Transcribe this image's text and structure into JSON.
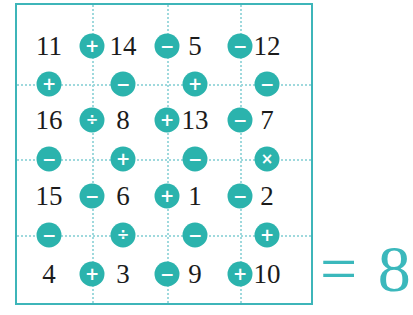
{
  "puzzle": {
    "title": "Math Operator Grid Puzzle",
    "result_text": "= 8",
    "result_equals": "=",
    "result_value": "8",
    "colors": {
      "accent_teal": "#2bb3ad",
      "border_teal": "#3db5b9",
      "guide_dotted": "#9fd9dd",
      "number_black": "#1b1b1b",
      "result_teal": "#3bb8bc",
      "background": "#ffffff"
    },
    "rows": [
      {
        "type": "numbers",
        "cells": [
          {
            "kind": "number",
            "text": "11"
          },
          {
            "kind": "operator",
            "text": "+",
            "name": "plus"
          },
          {
            "kind": "number",
            "text": "14"
          },
          {
            "kind": "operator",
            "text": "−",
            "name": "minus"
          },
          {
            "kind": "number",
            "text": "5"
          },
          {
            "kind": "operator",
            "text": "−",
            "name": "minus"
          },
          {
            "kind": "number",
            "text": "12"
          }
        ]
      },
      {
        "type": "operators",
        "cells": [
          {
            "kind": "operator",
            "text": "+",
            "name": "plus"
          },
          {
            "kind": "operator",
            "text": "−",
            "name": "minus"
          },
          {
            "kind": "operator",
            "text": "+",
            "name": "plus"
          },
          {
            "kind": "operator",
            "text": "−",
            "name": "minus"
          }
        ]
      },
      {
        "type": "numbers",
        "cells": [
          {
            "kind": "number",
            "text": "16"
          },
          {
            "kind": "operator",
            "text": "÷",
            "name": "divide"
          },
          {
            "kind": "number",
            "text": "8"
          },
          {
            "kind": "operator",
            "text": "+",
            "name": "plus"
          },
          {
            "kind": "number",
            "text": "13"
          },
          {
            "kind": "operator",
            "text": "−",
            "name": "minus"
          },
          {
            "kind": "number",
            "text": "7"
          }
        ]
      },
      {
        "type": "operators",
        "cells": [
          {
            "kind": "operator",
            "text": "−",
            "name": "minus"
          },
          {
            "kind": "operator",
            "text": "+",
            "name": "plus"
          },
          {
            "kind": "operator",
            "text": "−",
            "name": "minus"
          },
          {
            "kind": "operator",
            "text": "×",
            "name": "multiply"
          }
        ]
      },
      {
        "type": "numbers",
        "cells": [
          {
            "kind": "number",
            "text": "15"
          },
          {
            "kind": "operator",
            "text": "−",
            "name": "minus"
          },
          {
            "kind": "number",
            "text": "6"
          },
          {
            "kind": "operator",
            "text": "+",
            "name": "plus"
          },
          {
            "kind": "number",
            "text": "1"
          },
          {
            "kind": "operator",
            "text": "−",
            "name": "minus"
          },
          {
            "kind": "number",
            "text": "2"
          }
        ]
      },
      {
        "type": "operators",
        "cells": [
          {
            "kind": "operator",
            "text": "−",
            "name": "minus"
          },
          {
            "kind": "operator",
            "text": "÷",
            "name": "divide"
          },
          {
            "kind": "operator",
            "text": "−",
            "name": "minus"
          },
          {
            "kind": "operator",
            "text": "+",
            "name": "plus"
          }
        ]
      },
      {
        "type": "numbers",
        "cells": [
          {
            "kind": "number",
            "text": "4"
          },
          {
            "kind": "operator",
            "text": "+",
            "name": "plus"
          },
          {
            "kind": "number",
            "text": "3"
          },
          {
            "kind": "operator",
            "text": "−",
            "name": "minus"
          },
          {
            "kind": "number",
            "text": "9"
          },
          {
            "kind": "operator",
            "text": "+",
            "name": "plus"
          },
          {
            "kind": "number",
            "text": "10"
          }
        ]
      }
    ],
    "layout": {
      "number_columns_x": [
        47,
        121,
        193,
        265
      ],
      "operator_columns_x": [
        90,
        165,
        238
      ],
      "number_rows_y": [
        44,
        118,
        194,
        272
      ],
      "operator_rows_y": [
        82,
        157,
        233
      ],
      "guide_vlines_x": [
        90,
        165,
        238
      ],
      "guide_hlines_y": [
        82,
        157,
        233
      ]
    }
  }
}
